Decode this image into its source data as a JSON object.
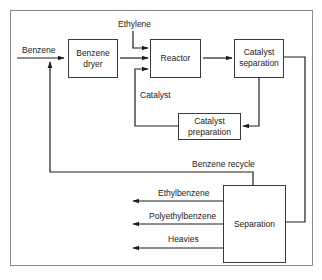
{
  "diagram": {
    "colors": {
      "line": "#1e1e1e",
      "box_border": "#3a3a3a",
      "frame": "#8a8a8a",
      "background": "#ffffff"
    },
    "units": {
      "benzene_dryer": {
        "line1": "Benzene",
        "line2": "dryer"
      },
      "reactor": {
        "label": "Reactor"
      },
      "catalyst_separation": {
        "line1": "Catalyst",
        "line2": "separation"
      },
      "catalyst_preparation": {
        "line1": "Catalyst",
        "line2": "preparation"
      },
      "separation": {
        "label": "Separation"
      }
    },
    "streams": {
      "benzene_feed": "Benzene",
      "ethylene_feed": "Ethylene",
      "catalyst": "Catalyst",
      "benzene_recycle": "Benzene recycle",
      "ethylbenzene": "Ethylbenzene",
      "polyethylbenzene": "Polyethylbenzene",
      "heavies": "Heavies"
    }
  }
}
